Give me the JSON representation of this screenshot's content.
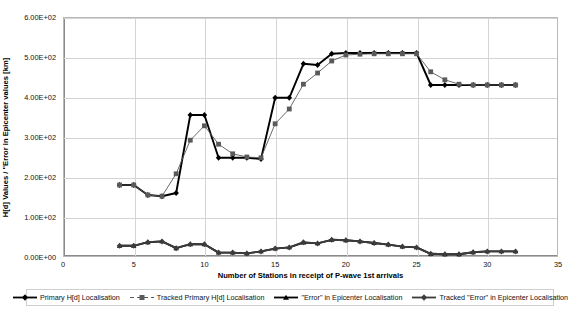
{
  "chart_data": {
    "type": "line",
    "title": "",
    "xlabel": "Number of Stations in receipt of P-wave 1st arrivals",
    "ylabel": "H[d] Values / \"Error in Epicenter values [km]",
    "xlim": [
      0,
      35
    ],
    "ylim": [
      0,
      600
    ],
    "xticks": [
      0,
      5,
      10,
      15,
      20,
      25,
      30,
      35
    ],
    "xtick_labels": [
      "0",
      "5",
      "10",
      "15",
      "20",
      "25",
      "30",
      "35"
    ],
    "yticks": [
      0,
      100,
      200,
      300,
      400,
      500,
      600
    ],
    "ytick_labels": [
      "0.00E+00",
      "1.00E+02",
      "2.00E+02",
      "3.00E+02",
      "4.00E+02",
      "5.00E+02",
      "6.00E+02"
    ],
    "grid": true,
    "legend_position": "bottom",
    "x": [
      4,
      5,
      6,
      7,
      8,
      9,
      10,
      11,
      12,
      13,
      14,
      15,
      16,
      17,
      18,
      19,
      20,
      21,
      22,
      23,
      24,
      25,
      26,
      27,
      28,
      29,
      30,
      31,
      32
    ],
    "series": [
      {
        "name": "Primary H[d] Localisation",
        "color": "#000000",
        "marker": "diamond",
        "values": [
          180,
          180,
          155,
          152,
          160,
          355,
          355,
          248,
          248,
          248,
          245,
          398,
          398,
          483,
          480,
          508,
          510,
          510,
          510,
          510,
          510,
          510,
          430,
          430,
          430,
          430,
          430,
          430,
          430
        ]
      },
      {
        "name": "Tracked Primary H[d] Localisation",
        "color": "#5a5a5a",
        "marker": "square",
        "values": [
          180,
          180,
          155,
          152,
          208,
          292,
          328,
          282,
          258,
          250,
          248,
          333,
          370,
          432,
          460,
          490,
          505,
          507,
          508,
          508,
          508,
          508,
          463,
          443,
          432,
          430,
          430,
          430,
          430
        ]
      },
      {
        "name": "\"Error\" in Epicenter Localisation",
        "color": "#000000",
        "marker": "triangle",
        "values": [
          28,
          28,
          37,
          39,
          22,
          32,
          32,
          11,
          11,
          9,
          14,
          21,
          24,
          36,
          34,
          43,
          42,
          39,
          35,
          31,
          26,
          24,
          8,
          7,
          7,
          12,
          14,
          14,
          14
        ]
      },
      {
        "name": "Tracked \"Error\" in Epicenter Localisation",
        "color": "#3c3c3c",
        "marker": "diamond",
        "values": [
          28,
          28,
          37,
          39,
          22,
          32,
          32,
          11,
          11,
          9,
          14,
          21,
          24,
          37,
          34,
          43,
          42,
          39,
          35,
          31,
          26,
          24,
          8,
          7,
          7,
          12,
          14,
          14,
          14
        ]
      }
    ]
  },
  "legend": {
    "items": [
      {
        "label": "Primary H[d] Localisation",
        "marker": "diamond-marker",
        "color": "#000000"
      },
      {
        "label": "Tracked Primary H[d] Localisation",
        "marker": "square-marker",
        "color": "#5a5a5a"
      },
      {
        "label": "\"Error\" in Epicenter Localisation",
        "marker": "triangle-marker",
        "color": "#000000"
      },
      {
        "label": "Tracked \"Error\" in Epicenter Localisation",
        "marker": "diamond-marker",
        "color": "#3c3c3c"
      }
    ]
  },
  "caption": ""
}
